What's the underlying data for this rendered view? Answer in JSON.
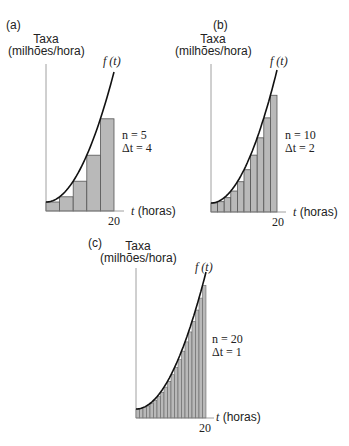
{
  "chart_data": [
    {
      "type": "bar",
      "panel": "(a)",
      "title": "",
      "ylabel": "Taxa (milhões/hora)",
      "xlabel": "t (horas)",
      "curve_label": "f(t)",
      "n": 5,
      "dt": 4,
      "x_tick": "20",
      "categories": [
        0,
        4,
        8,
        12,
        16
      ],
      "values_relative": [
        0.065,
        0.1,
        0.22,
        0.4,
        0.68
      ],
      "curve_end_relative": 1.0,
      "xlim": [
        0,
        20
      ],
      "grid": false
    },
    {
      "type": "bar",
      "panel": "(b)",
      "ylabel": "Taxa (milhões/hora)",
      "xlabel": "t (horas)",
      "curve_label": "f(t)",
      "n": 10,
      "dt": 2,
      "x_tick": "20",
      "categories": [
        0,
        2,
        4,
        6,
        8,
        10,
        12,
        14,
        16,
        18
      ],
      "xlim": [
        0,
        20
      ],
      "grid": false
    },
    {
      "type": "bar",
      "panel": "(c)",
      "ylabel": "Taxa (milhões/hora)",
      "xlabel": "t (horas)",
      "curve_label": "f(t)",
      "n": 20,
      "dt": 1,
      "x_tick": "20",
      "categories": [
        0,
        1,
        2,
        3,
        4,
        5,
        6,
        7,
        8,
        9,
        10,
        11,
        12,
        13,
        14,
        15,
        16,
        17,
        18,
        19
      ],
      "xlim": [
        0,
        20
      ],
      "grid": false
    }
  ],
  "panels": {
    "a": {
      "label": "(a)",
      "ylabel1": "Taxa",
      "ylabel2": "(milhões/hora)",
      "fname": "f (t)",
      "n_text": "n = 5",
      "dt_text": "Δt = 4",
      "xlabel_t": "t",
      "xlabel_unit": " (horas)",
      "tick": "20",
      "n": 5
    },
    "b": {
      "label": "(b)",
      "ylabel1": "Taxa",
      "ylabel2": "(milhões/hora)",
      "fname": "f (t)",
      "n_text": "n = 10",
      "dt_text": "Δt = 2",
      "xlabel_t": "t",
      "xlabel_unit": " (horas)",
      "tick": "20",
      "n": 10
    },
    "c": {
      "label": "(c)",
      "ylabel1": "Taxa",
      "ylabel2": "(milhões/hora)",
      "fname": "f (t)",
      "n_text": "n = 20",
      "dt_text": "Δt = 1",
      "xlabel_t": "t",
      "xlabel_unit": " (horas)",
      "tick": "20",
      "n": 20
    }
  },
  "colors": {
    "bar_fill": "#b9b9b9",
    "bar_stroke": "#555555",
    "curve": "#111111",
    "axis": "#888888"
  }
}
